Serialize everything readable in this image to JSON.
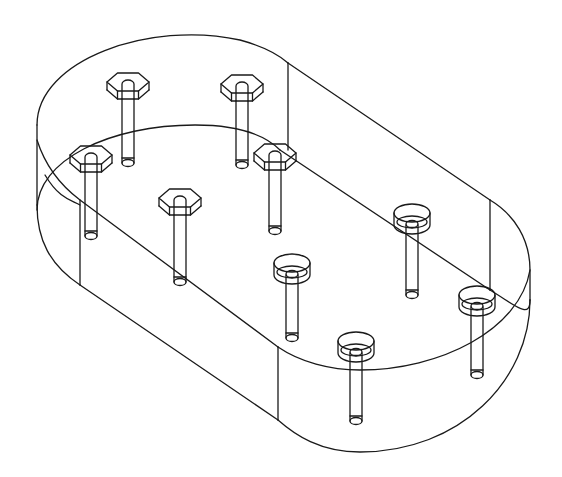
{
  "drawing": {
    "kind": "isometric wireframe",
    "subject": "obround plate with bolts",
    "stroke_color": "#1a1a1a",
    "background": "#ffffff",
    "plate_outline": [
      "M 37 205 L 37 125",
      "M 37 125 C 37 60, 150 20, 240 40 C 262 46, 278 54, 288 63",
      "M 288 63 L 490 200",
      "M 490 200 C 515 215, 530 240, 530 270 L 530 300",
      "M 530 300 C 530 380, 460 452, 360 452 C 320 452, 295 435, 278 420",
      "M 278 420 L 80 285",
      "M 80 285 C 50 265, 37 240, 37 205",
      "M 37 210 C 37 160, 110 125, 195 125 C 240 125, 265 135, 280 150",
      "M 280 150 L 490 290",
      "M 490 290 C 515 305, 530 320, 530 300",
      "M 45 175 C 60 200, 72 200, 80 205",
      "M 37 140 C 45 165, 60 185, 80 200 L 278 347",
      "M 278 347 C 300 362, 330 370, 360 370 C 440 370, 520 330, 530 270",
      "M 288 63 L 288 150",
      "M 490 200 L 490 290",
      "M 278 347 L 278 420",
      "M 80 200 L 80 285"
    ],
    "hex_bolts": [
      {
        "cx": 128,
        "cy": 82,
        "shaft_bottom": 163
      },
      {
        "cx": 242,
        "cy": 84,
        "shaft_bottom": 165
      },
      {
        "cx": 91,
        "cy": 155,
        "shaft_bottom": 236
      },
      {
        "cx": 275,
        "cy": 153,
        "shaft_bottom": 231
      },
      {
        "cx": 180,
        "cy": 198,
        "shaft_bottom": 282
      }
    ],
    "round_bolts": [
      {
        "cx": 412,
        "cy": 213,
        "shaft_bottom": 295
      },
      {
        "cx": 292,
        "cy": 263,
        "shaft_bottom": 338
      },
      {
        "cx": 477,
        "cy": 295,
        "shaft_bottom": 375
      },
      {
        "cx": 356,
        "cy": 341,
        "shaft_bottom": 421
      }
    ]
  }
}
